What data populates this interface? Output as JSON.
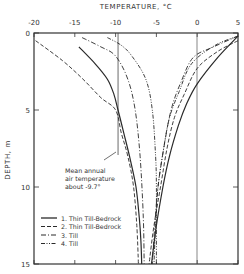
{
  "chart_data": {
    "type": "line",
    "title": "",
    "xlabel": "TEMPERATURE, °C",
    "ylabel": "DEPTH, m",
    "xlim": [
      -20,
      5
    ],
    "ylim": [
      15,
      0
    ],
    "x_ticks": [
      "-20",
      "-15",
      "-10",
      "-5",
      "0",
      "5"
    ],
    "y_ticks": [
      "0",
      "5",
      "10",
      "15"
    ],
    "grid": false,
    "legend_position": "lower-left inside",
    "reference_line": {
      "x": -9.7,
      "label": "Mean annual air temperature about -9.7°"
    },
    "annotation": {
      "line1": "Mean annual",
      "line2": "air temperature",
      "line3": "about  -9.7°"
    },
    "series": [
      {
        "name": "1. Thin Till-Bedrock",
        "style": "solid",
        "winter_profile": [
          [
            -14.5,
            0.9
          ],
          [
            -12.5,
            2
          ],
          [
            -11,
            3
          ],
          [
            -10.2,
            4
          ],
          [
            -9.7,
            5
          ],
          [
            -9,
            6.5
          ],
          [
            -8.3,
            8
          ],
          [
            -7.5,
            10
          ],
          [
            -7.1,
            12
          ],
          [
            -6.9,
            13.5
          ],
          [
            -6.8,
            15
          ]
        ],
        "summer_profile": [
          [
            5,
            0.2
          ],
          [
            2.5,
            1.6
          ],
          [
            0,
            3.3
          ],
          [
            -1.3,
            4.6
          ],
          [
            -2.3,
            6
          ],
          [
            -3.4,
            8
          ],
          [
            -4.2,
            10
          ],
          [
            -5,
            12.5
          ],
          [
            -5.6,
            15
          ]
        ]
      },
      {
        "name": "2. Thin Till-Bedrock",
        "style": "dashed",
        "winter_profile": [
          [
            -19.8,
            0.5
          ],
          [
            -16.5,
            1.8
          ],
          [
            -14,
            3
          ],
          [
            -11.8,
            4.2
          ],
          [
            -10,
            5
          ],
          [
            -9.3,
            6.5
          ],
          [
            -8.5,
            8
          ],
          [
            -7.8,
            10
          ],
          [
            -7.4,
            12.5
          ],
          [
            -7.2,
            15
          ]
        ],
        "summer_profile": [
          [
            5,
            0.5
          ],
          [
            2.5,
            1.2
          ],
          [
            0,
            2.3
          ],
          [
            -1.6,
            4
          ],
          [
            -2.8,
            5.5
          ],
          [
            -3.7,
            7.5
          ],
          [
            -4.5,
            10
          ],
          [
            -5.3,
            12.5
          ],
          [
            -5.9,
            15
          ]
        ]
      },
      {
        "name": "3. Till",
        "style": "dash-dot",
        "winter_profile": [
          [
            -14.1,
            0.3
          ],
          [
            -11.8,
            0.9
          ],
          [
            -10,
            1.5
          ],
          [
            -8.5,
            3
          ],
          [
            -7.6,
            5
          ],
          [
            -7,
            8
          ],
          [
            -6.6,
            12
          ],
          [
            -6.5,
            15
          ]
        ],
        "summer_profile": [
          [
            5,
            0.2
          ],
          [
            2,
            0.9
          ],
          [
            -0.5,
            1.6
          ],
          [
            -2,
            3.2
          ],
          [
            -3.2,
            5
          ],
          [
            -4.1,
            7.5
          ],
          [
            -4.8,
            10
          ],
          [
            -5.2,
            12.5
          ],
          [
            -5.5,
            15
          ]
        ]
      },
      {
        "name": "4. Till",
        "style": "dash-dot-dot",
        "winter_profile": [
          [
            -11,
            0.3
          ],
          [
            -9.3,
            0.8
          ],
          [
            -8,
            1.5
          ],
          [
            -6.3,
            3
          ],
          [
            -5.5,
            5
          ],
          [
            -5.1,
            8
          ],
          [
            -5,
            10
          ],
          [
            -5,
            12.5
          ],
          [
            -5,
            15
          ]
        ],
        "summer_profile": [
          [
            5,
            0.2
          ],
          [
            2.2,
            0.8
          ],
          [
            -0.7,
            2
          ],
          [
            -2.2,
            3.8
          ],
          [
            -3.4,
            5.5
          ],
          [
            -4.2,
            7.8
          ],
          [
            -4.8,
            10
          ],
          [
            -5.1,
            12.5
          ],
          [
            -5.3,
            15
          ]
        ]
      }
    ]
  },
  "legend": {
    "items": [
      {
        "label": "1. Thin Till-Bedrock",
        "style": "solid"
      },
      {
        "label": "2. Thin Till-Bedrock",
        "style": "dashed"
      },
      {
        "label": "3. Till",
        "style": "dash-dot"
      },
      {
        "label": "4. Till",
        "style": "dash-dot-dot"
      }
    ]
  },
  "colors": {
    "line": "#2a2a2a",
    "frame": "#333333",
    "text": "#333333"
  }
}
